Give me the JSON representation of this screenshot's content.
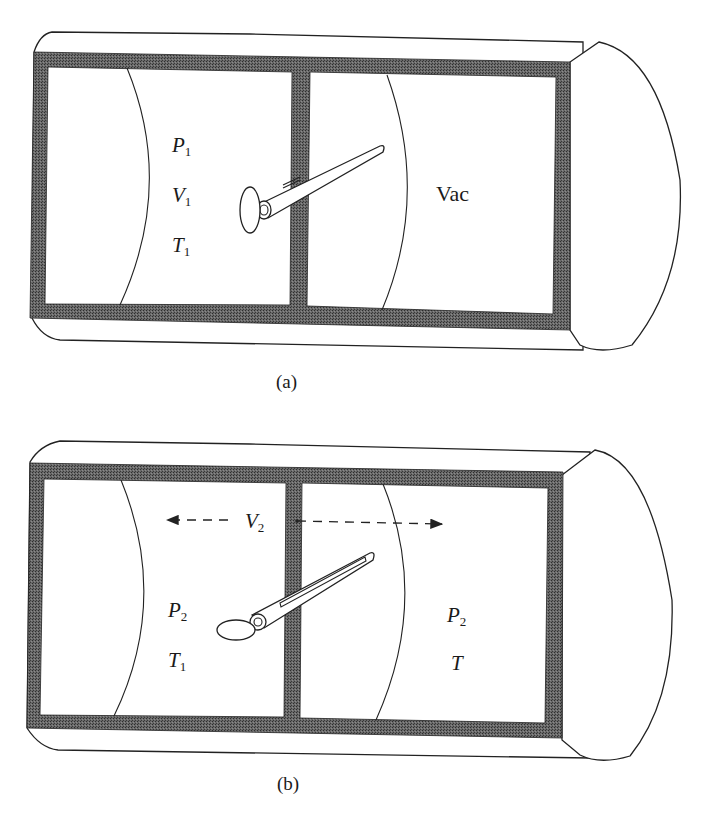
{
  "figure": {
    "panel_a": {
      "caption": "(a)",
      "left_chamber": {
        "labels": [
          {
            "symbol": "P",
            "subscript": "1"
          },
          {
            "symbol": "V",
            "subscript": "1"
          },
          {
            "symbol": "T",
            "subscript": "1"
          }
        ]
      },
      "right_chamber": {
        "label": "Vac"
      },
      "valve_state": "closed"
    },
    "panel_b": {
      "caption": "(b)",
      "volume_label": {
        "symbol": "V",
        "subscript": "2"
      },
      "left_chamber": {
        "labels": [
          {
            "symbol": "P",
            "subscript": "2"
          },
          {
            "symbol": "T",
            "subscript": "1"
          }
        ]
      },
      "right_chamber": {
        "labels": [
          {
            "symbol": "P",
            "subscript": "2"
          },
          {
            "symbol": "T",
            "subscript": ""
          }
        ]
      },
      "valve_state": "open"
    },
    "colors": {
      "wall_fill": "#5a5a5a",
      "line": "#222222",
      "background": "#ffffff"
    }
  }
}
